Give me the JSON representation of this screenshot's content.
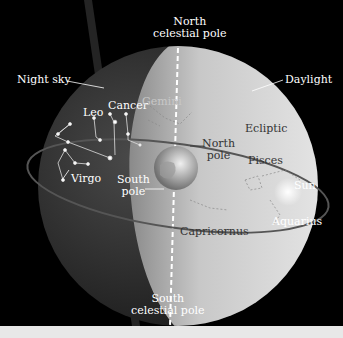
{
  "diagram": {
    "type": "celestial-sphere",
    "labels": {
      "north_celestial_pole": [
        "North",
        "celestial pole"
      ],
      "south_celestial_pole": [
        "South",
        "celestial pole"
      ],
      "night_sky": "Night sky",
      "daylight": "Daylight",
      "ecliptic": "Ecliptic",
      "north_pole": [
        "North",
        "pole"
      ],
      "south_pole": [
        "South",
        "pole"
      ],
      "sun": "Sun"
    },
    "constellations": [
      "Leo",
      "Cancer",
      "Gemini",
      "Virgo",
      "Pisces",
      "Aquarius",
      "Capricornus"
    ],
    "colors": {
      "background": "#000000",
      "night_hemisphere": "#3a3a3a",
      "day_hemisphere": "#d8d8d8",
      "ecliptic_line": "#555555",
      "label_light": "#ffffff",
      "label_dark": "#333333"
    }
  }
}
